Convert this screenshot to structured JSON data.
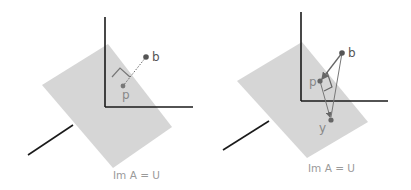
{
  "colors": {
    "plane": "#d6d6d6",
    "axis": "#1a1a1a",
    "point": "#555555",
    "vector": "#666666",
    "label": "#555555",
    "caption": "#9a9a9a"
  },
  "panels": [
    {
      "id": "left",
      "points": {
        "b": {
          "label": "b",
          "x": 146,
          "y": 57
        },
        "p": {
          "label": "p",
          "x": 123,
          "y": 86
        }
      },
      "caption": "Im A = U"
    },
    {
      "id": "right",
      "points": {
        "b": {
          "label": "b",
          "x": 342,
          "y": 53
        },
        "p": {
          "label": "p",
          "x": 320,
          "y": 81
        },
        "y": {
          "label": "y",
          "x": 331,
          "y": 120
        }
      },
      "caption": "Im A = U"
    }
  ]
}
